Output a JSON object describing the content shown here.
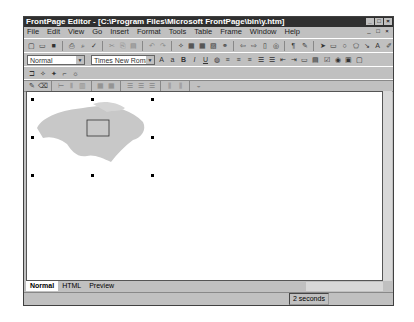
{
  "window": {
    "title": "FrontPage Editor - [C:\\Program Files\\Microsoft FrontPage\\bin\\y.htm]"
  },
  "menu": [
    "File",
    "Edit",
    "View",
    "Go",
    "Insert",
    "Format",
    "Tools",
    "Table",
    "Frame",
    "Window",
    "Help"
  ],
  "format_bar": {
    "style": "Normal",
    "font": "Times New Roman"
  },
  "tabs": [
    "Normal",
    "HTML",
    "Preview"
  ],
  "status": {
    "text": "2 seconds"
  }
}
